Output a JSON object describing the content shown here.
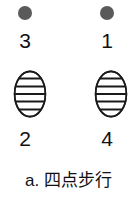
{
  "figure": {
    "caption": "a. 四点步行",
    "caption_label": "a.",
    "caption_text": "四点步行",
    "background_color": "#ffffff",
    "ink_color": "#111111",
    "dot_color": "#5a5a5a",
    "oval_fill": "#ffffff",
    "oval_stroke": "#1a1a1a"
  },
  "markers": {
    "top_left_dot": {
      "icon": "filled-circle-icon",
      "shape": "circle",
      "color": "#5a5a5a",
      "label": "3"
    },
    "top_right_dot": {
      "icon": "filled-circle-icon",
      "shape": "circle",
      "color": "#5a5a5a",
      "label": "1"
    },
    "bottom_left_oval": {
      "icon": "striped-oval-icon",
      "shape": "striped-ellipse",
      "stripe_count": 5,
      "label": "2"
    },
    "bottom_right_oval": {
      "icon": "striped-oval-icon",
      "shape": "striped-ellipse",
      "stripe_count": 5,
      "label": "4"
    }
  },
  "sequence": {
    "order": [
      "1",
      "2",
      "3",
      "4"
    ],
    "labels": {
      "top_left": "3",
      "top_right": "1",
      "bottom_left": "2",
      "bottom_right": "4"
    }
  }
}
